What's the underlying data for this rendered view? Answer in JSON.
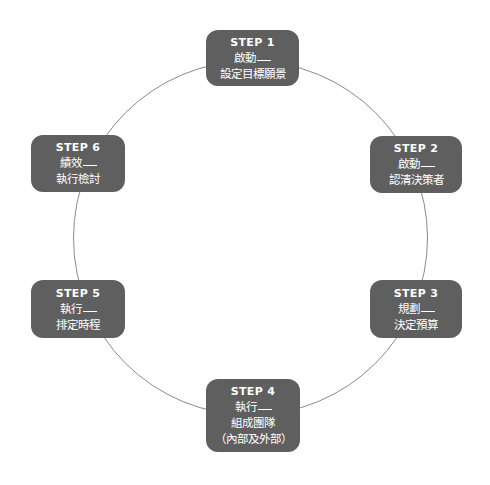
{
  "diagram": {
    "type": "cycle",
    "colors": {
      "box_fill": "#5f5f5f",
      "box_text": "#ffffff",
      "ring_stroke": "#8a8a8a",
      "background": "#ffffff"
    },
    "steps": [
      {
        "title": "STEP 1",
        "phase": "啟動",
        "lines": [
          "設定目標願景"
        ]
      },
      {
        "title": "STEP 2",
        "phase": "啟動",
        "lines": [
          "認清決策者"
        ]
      },
      {
        "title": "STEP 3",
        "phase": "規劃",
        "lines": [
          "決定預算"
        ]
      },
      {
        "title": "STEP 4",
        "phase": "執行",
        "lines": [
          "組成團隊",
          "（內部及外部）"
        ]
      },
      {
        "title": "STEP 5",
        "phase": "執行",
        "lines": [
          "排定時程"
        ]
      },
      {
        "title": "STEP 6",
        "phase": "績效",
        "lines": [
          "執行檢討"
        ]
      }
    ]
  }
}
